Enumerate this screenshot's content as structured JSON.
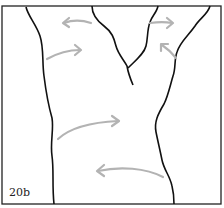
{
  "figure": {
    "label": "20b",
    "colors": {
      "outline": "#111111",
      "arrow": "#b3b3b3",
      "background": "#ffffff"
    },
    "arrows": [
      {
        "id": "top-left",
        "direction": "left",
        "position": "upper-left of fork"
      },
      {
        "id": "top-right",
        "direction": "right",
        "position": "upper-right of fork"
      },
      {
        "id": "mid-left",
        "direction": "right",
        "position": "left trunk edge, upper"
      },
      {
        "id": "mid-right",
        "direction": "up-left",
        "position": "right trunk edge, upper"
      },
      {
        "id": "lower-center",
        "direction": "right",
        "position": "left trunk edge, middle"
      },
      {
        "id": "bottom",
        "direction": "left",
        "position": "right trunk edge, lower"
      }
    ]
  }
}
